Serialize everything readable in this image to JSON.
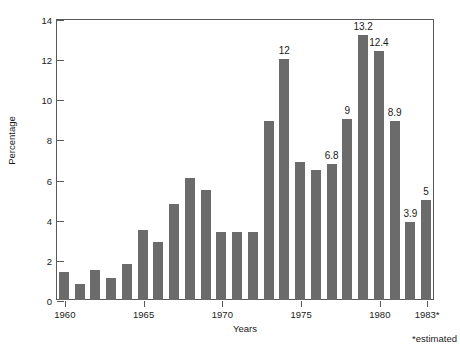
{
  "chart_data": {
    "type": "bar",
    "title": "",
    "xlabel": "Years",
    "ylabel": "Percentage",
    "ylim": [
      0,
      14
    ],
    "yticks": [
      0,
      2,
      4,
      6,
      8,
      10,
      12,
      14
    ],
    "xticks": [
      "1960",
      "1965",
      "1970",
      "1975",
      "1980",
      "1983*"
    ],
    "xtick_years": [
      1960,
      1965,
      1970,
      1975,
      1980,
      1983
    ],
    "grid": false,
    "legend": null,
    "annotations": [
      "*estimated"
    ],
    "bar_color": "#6b6b6b",
    "axis_color": "#5a5a5a",
    "categories": [
      "1960",
      "1961",
      "1962",
      "1963",
      "1964",
      "1965",
      "1966",
      "1967",
      "1968",
      "1969",
      "1970",
      "1971",
      "1972",
      "1973",
      "1974",
      "1975",
      "1976",
      "1977",
      "1978",
      "1979",
      "1980",
      "1981",
      "1982",
      "1983"
    ],
    "values": [
      1.4,
      0.8,
      1.5,
      1.1,
      1.8,
      3.5,
      2.9,
      4.8,
      6.1,
      5.5,
      3.4,
      3.4,
      3.4,
      8.9,
      12.0,
      6.9,
      6.5,
      6.8,
      9.0,
      13.2,
      12.4,
      8.9,
      3.9,
      5.0
    ],
    "point_labels": [
      "",
      "",
      "",
      "",
      "",
      "",
      "",
      "",
      "",
      "",
      "",
      "",
      "",
      "",
      "12",
      "",
      "",
      "6.8",
      "9",
      "13.2",
      "12.4",
      "8.9",
      "3.9",
      "5"
    ]
  }
}
